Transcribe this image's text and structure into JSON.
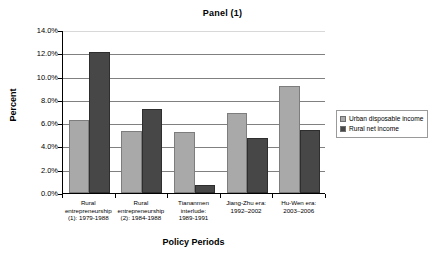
{
  "chart_data": {
    "type": "bar",
    "title": "Panel (1)",
    "xlabel": "Policy Periods",
    "ylabel": "Percent",
    "ylim": [
      0,
      14
    ],
    "ytick_labels": [
      "0.0%",
      "2.0%",
      "4.0%",
      "6.0%",
      "8.0%",
      "10.0%",
      "12.0%",
      "14.0%"
    ],
    "ytick_values": [
      0,
      2,
      4,
      6,
      8,
      10,
      12,
      14
    ],
    "grid": true,
    "legend_position": "right",
    "categories": [
      "Rural entrepreneurship (1): 1979-1988",
      "Rural entrepreneurship (2): 1984-1988",
      "Tiananmen interlude: 1989-1991",
      "Jiang-Zhu era: 1992–2002",
      "Hu-Wen era: 2003–2006"
    ],
    "category_lines": [
      [
        "Rural",
        "entrepreneurship",
        "(1): 1979-1988"
      ],
      [
        "Rural",
        "entrepreneurship",
        "(2): 1984-1988"
      ],
      [
        "Tiananmen",
        "interlude:",
        "1989-1991"
      ],
      [
        "Jiang-Zhu era:",
        "1992–2002"
      ],
      [
        "Hu-Wen era:",
        "2003–2006"
      ]
    ],
    "series": [
      {
        "name": "Urban disposable income",
        "color": "#a9a9a9",
        "values": [
          6.3,
          5.35,
          5.25,
          6.9,
          9.15
        ]
      },
      {
        "name": "Rural net income",
        "color": "#474747",
        "values": [
          12.15,
          7.2,
          0.65,
          4.7,
          5.4
        ]
      }
    ]
  },
  "legend": {
    "items": [
      {
        "label": "Urban disposable income",
        "swatch": "urban"
      },
      {
        "label": "Rural net income",
        "swatch": "rural"
      }
    ]
  }
}
